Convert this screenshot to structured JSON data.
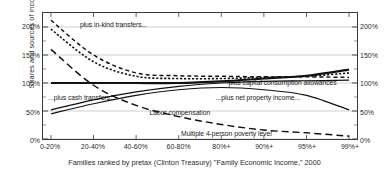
{
  "chart_data": {
    "type": "line",
    "title": "",
    "subtitle": "",
    "xlabel": "Families ranked by pretax (Clinton Treasury) \"Family Economic Income,\" 2000",
    "ylabel": "Shares and sources of income",
    "categories": [
      "0-20%",
      "20-40%",
      "40-60%",
      "60-80%",
      "80%+",
      "90%+",
      "95%+",
      "99%+"
    ],
    "ylim": [
      0,
      225
    ],
    "yticks": [
      0,
      50,
      100,
      150,
      200
    ],
    "ytick_labels": [
      "0%",
      "50%",
      "100%",
      "150%",
      "200%"
    ],
    "ytick_labels_right": [
      "0%",
      "50%",
      "100%",
      "150%",
      "200%"
    ],
    "grid": "horizontal",
    "legend": "inline-annotations",
    "series": [
      {
        "name": "plus in-kind transfers...",
        "style": "dashed",
        "values": [
          212,
          150,
          118,
          113,
          112,
          111,
          111,
          110
        ]
      },
      {
        "name": "plus capital consumption allowances",
        "style": "dotted",
        "values": [
          196,
          138,
          112,
          108,
          108,
          110,
          112,
          118
        ]
      },
      {
        "name": "...plus net property income...",
        "style": "solid-thick",
        "values": [
          100,
          100,
          100,
          100,
          103,
          108,
          113,
          124
        ]
      },
      {
        "name": "...plus cash transfers...",
        "style": "solid",
        "values": [
          52,
          70,
          84,
          94,
          100,
          103,
          104,
          105
        ]
      },
      {
        "name": "Labor compensation",
        "style": "solid",
        "values": [
          45,
          63,
          78,
          88,
          92,
          88,
          78,
          52
        ]
      },
      {
        "name": "Multiple 4-person poverty level",
        "style": "long-dash",
        "values": [
          160,
          96,
          60,
          40,
          26,
          16,
          11,
          5
        ]
      }
    ],
    "annotations": [
      {
        "text": "plus in-kind transfers...",
        "x_pct": 12,
        "y_pct": 7
      },
      {
        "text": "plus capital consumption allowances",
        "x_pct": 59,
        "y_pct": 52
      },
      {
        "text": "...plus net property income...",
        "x_pct": 55,
        "y_pct": 64
      },
      {
        "text": "...plus cash transfers...",
        "x_pct": 2,
        "y_pct": 64
      },
      {
        "text": "Labor compensation",
        "x_pct": 34,
        "y_pct": 76
      },
      {
        "text": "Multiple 4-person poverty level",
        "x_pct": 44,
        "y_pct": 92
      }
    ]
  }
}
